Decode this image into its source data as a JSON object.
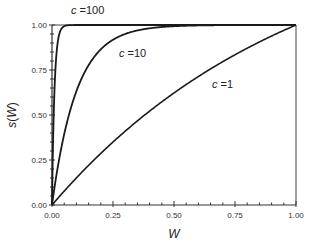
{
  "chart_data": {
    "type": "line",
    "title": "",
    "xlabel": "W",
    "ylabel": "s(W)",
    "xlim": [
      0,
      1
    ],
    "ylim": [
      0,
      1
    ],
    "grid": false,
    "legend": "inline curve labels",
    "function": "s(W) = (1 - exp(-c*W)) / (1 - exp(-c))",
    "x_ticks": [
      "0.00",
      "0.25",
      "0.50",
      "0.75",
      "1.00"
    ],
    "y_ticks": [
      "0.00",
      "0.25",
      "0.50",
      "0.75",
      "1.00"
    ],
    "minor_tick_step": 0.05,
    "x": [
      0,
      0.01,
      0.02,
      0.03,
      0.05,
      0.1,
      0.15,
      0.2,
      0.25,
      0.3,
      0.4,
      0.5,
      0.6,
      0.7,
      0.8,
      0.9,
      1.0
    ],
    "series": [
      {
        "name": "c =100",
        "c": 100,
        "values": [
          0,
          0.632,
          0.865,
          0.95,
          0.993,
          1.0,
          1.0,
          1.0,
          1.0,
          1.0,
          1.0,
          1.0,
          1.0,
          1.0,
          1.0,
          1.0,
          1.0
        ]
      },
      {
        "name": "c =10",
        "c": 10,
        "values": [
          0,
          0.095,
          0.181,
          0.259,
          0.393,
          0.632,
          0.777,
          0.865,
          0.918,
          0.95,
          0.982,
          0.993,
          0.998,
          0.999,
          1.0,
          1.0,
          1.0
        ]
      },
      {
        "name": "c =1",
        "c": 1,
        "values": [
          0,
          0.016,
          0.031,
          0.047,
          0.077,
          0.151,
          0.22,
          0.287,
          0.35,
          0.41,
          0.521,
          0.622,
          0.713,
          0.797,
          0.873,
          0.942,
          1.0
        ]
      }
    ],
    "annotations": [
      {
        "text": "c =100",
        "near": "top-left, above curve plateau"
      },
      {
        "text": "c =10",
        "near": "W≈0.3, s≈0.85"
      },
      {
        "text": "c =1",
        "near": "W≈0.7, s≈0.68"
      }
    ]
  },
  "labels": {
    "xlabel": "W",
    "ylabel_s": "s",
    "ylabel_open": "(",
    "ylabel_w": "W",
    "ylabel_close": ")",
    "c100_var": "c",
    "c100_val": " =100",
    "c10_var": "c",
    "c10_val": " =10",
    "c1_var": "c",
    "c1_val": " =1",
    "xt0": "0.00",
    "xt1": "0.25",
    "xt2": "0.50",
    "xt3": "0.75",
    "xt4": "1.00",
    "yt0": "0.00",
    "yt1": "0.25",
    "yt2": "0.50",
    "yt3": "0.75",
    "yt4": "1.00"
  },
  "colors": {
    "line": "#1a1a1a",
    "axis": "#333333",
    "background": "#ffffff"
  }
}
